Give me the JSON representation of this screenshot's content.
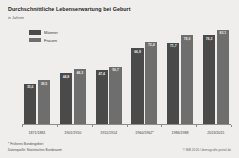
{
  "header": {
    "title": "Durchschnittliche Lebenserwartung bei Geburt",
    "subtitle": "in Jahren"
  },
  "legend": {
    "items": [
      {
        "label": "Männer",
        "color": "#4a4a4a"
      },
      {
        "label": "Frauen",
        "color": "#6e6e6e"
      }
    ]
  },
  "footer": {
    "footnote": "* Früheres Bundesgebiet",
    "source": "Datenquelle: Statistisches Bundesamt",
    "credit": "© BiB 2016 / demografie-portal.de"
  },
  "colors": {
    "background": "#efeeec",
    "men": "#4a4a4a",
    "women": "#6e6e6e",
    "axis": "#8e8d8b",
    "value_label": "#e9e8e6"
  },
  "chart_data": {
    "type": "bar",
    "title": "Durchschnittliche Lebenserwartung bei Geburt",
    "subtitle": "in Jahren",
    "xlabel": "",
    "ylabel": "in Jahren",
    "ylim": [
      0,
      88
    ],
    "grid": false,
    "legend_position": "top-left",
    "categories": [
      "1871/1881",
      "1901/1910",
      "1911/1914",
      "1960/1962*",
      "1986/1988",
      "2013/2015"
    ],
    "series": [
      {
        "name": "Männer",
        "color": "#4a4a4a",
        "values": [
          35.6,
          44.8,
          47.4,
          66.9,
          71.7,
          78.2
        ],
        "labels": [
          "35,6",
          "44,8",
          "47,4",
          "66,9",
          "71,7",
          "78,2"
        ]
      },
      {
        "name": "Frauen",
        "color": "#6e6e6e",
        "values": [
          38.5,
          48.3,
          50.7,
          72.4,
          78.0,
          83.1
        ],
        "labels": [
          "38,5",
          "48,3",
          "50,7",
          "72,4",
          "78,0",
          "83,1"
        ]
      }
    ],
    "annotations": [
      "* Früheres Bundesgebiet"
    ]
  }
}
